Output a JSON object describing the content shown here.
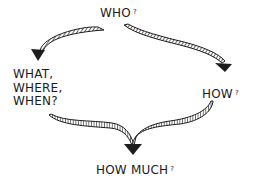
{
  "diagram": {
    "type": "flow",
    "style": "hand-drawn sketch with hatched ribbon arrows",
    "nodes": [
      {
        "id": "who",
        "text": "WHO",
        "suffix": "?"
      },
      {
        "id": "what_where_when",
        "lines": [
          "WHAT,",
          "WHERE,",
          "WHEN?"
        ]
      },
      {
        "id": "how",
        "text": "HOW",
        "suffix": "?"
      },
      {
        "id": "how_much",
        "text": "HOW MUCH",
        "suffix": "?"
      }
    ],
    "edges": [
      {
        "from": "who",
        "to": "what_where_when"
      },
      {
        "from": "who",
        "to": "how"
      },
      {
        "from": "what_where_when",
        "to": "how_much"
      },
      {
        "from": "how",
        "to": "how_much"
      }
    ],
    "colors": {
      "ink": "#1c1c1c",
      "background": "#ffffff"
    }
  }
}
